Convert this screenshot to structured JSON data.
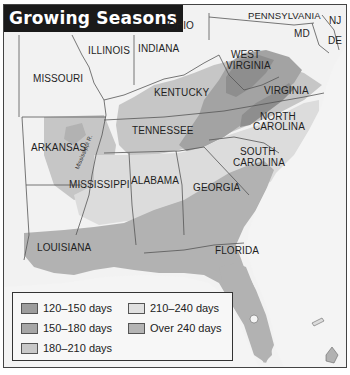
{
  "title": "Growing Seasons",
  "states": [
    {
      "name": "OHIO",
      "x": 167,
      "y": 18
    },
    {
      "name": "PENNSYLVANIA",
      "x": 247,
      "y": 8
    },
    {
      "name": "NJ",
      "x": 328,
      "y": 14
    },
    {
      "name": "MD",
      "x": 292,
      "y": 25
    },
    {
      "name": "DE",
      "x": 326,
      "y": 34
    },
    {
      "name": "ILLINOIS",
      "x": 85,
      "y": 42
    },
    {
      "name": "INDIANA",
      "x": 136,
      "y": 39
    },
    {
      "name": "WEST",
      "x": 229,
      "y": 47
    },
    {
      "name": "VIRGINIA",
      "x": 224,
      "y": 58
    },
    {
      "name": "MISSOURI",
      "x": 31,
      "y": 72
    },
    {
      "name": "KENTUCKY",
      "x": 152,
      "y": 85
    },
    {
      "name": "VIRGINIA",
      "x": 262,
      "y": 83
    },
    {
      "name": "NORTH",
      "x": 255,
      "y": 109
    },
    {
      "name": "CAROLINA",
      "x": 250,
      "y": 119
    },
    {
      "name": "TENNESSEE",
      "x": 130,
      "y": 124
    },
    {
      "name": "ARKANSAS",
      "x": 28,
      "y": 141
    },
    {
      "name": "SOUTH",
      "x": 236,
      "y": 145
    },
    {
      "name": "CAROLINA",
      "x": 229,
      "y": 157
    },
    {
      "name": "MISSISSIPPI",
      "x": 67,
      "y": 178
    },
    {
      "name": "ALABAMA",
      "x": 129,
      "y": 173
    },
    {
      "name": "GEORGIA",
      "x": 190,
      "y": 180
    },
    {
      "name": "LOUISIANA",
      "x": 35,
      "y": 240
    },
    {
      "name": "FLORIDA",
      "x": 213,
      "y": 243
    }
  ],
  "river_label": "Mississippi R.",
  "legend": {
    "items": [
      {
        "label": "120–150 days",
        "color": "#9a9a9a"
      },
      {
        "label": "150–180 days",
        "color": "#a8a8a8"
      },
      {
        "label": "180–210 days",
        "color": "#c4c4c4"
      },
      {
        "label": "210–240 days",
        "color": "#dedede"
      },
      {
        "label": "Over 240 days",
        "color": "#b4b4b4"
      }
    ]
  },
  "colors": {
    "background": "#f4f4f4",
    "title_bg": "#1a1a1a",
    "water": "#f4f4f4",
    "zone_120_150": "#8e8e8e",
    "zone_150_180": "#a3a3a3",
    "zone_180_210": "#c6c6c6",
    "zone_210_240": "#dcdcdc",
    "zone_over_240": "#b2b2b2"
  }
}
